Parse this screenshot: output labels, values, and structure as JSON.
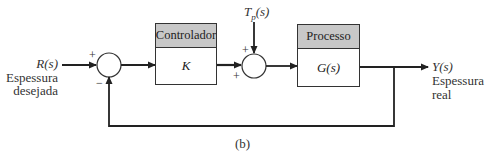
{
  "diagram": {
    "type": "block-diagram",
    "caption": "(b)",
    "input": {
      "symbol": "R(s)",
      "label_line1": "Espessura",
      "label_line2": "desejada"
    },
    "output": {
      "symbol": "Y(s)",
      "label_line1": "Espessura",
      "label_line2": "real"
    },
    "disturbance": {
      "symbol": "T",
      "subscript": "p",
      "suffix": "(s)"
    },
    "controller": {
      "title": "Controlador",
      "transfer": "K"
    },
    "process": {
      "title": "Processo",
      "transfer": "G(s)"
    },
    "summing_junction_1": {
      "plus_sign": "+",
      "minus_sign": "−"
    },
    "summing_junction_2": {
      "top_sign": "+",
      "left_sign": "+"
    },
    "colors": {
      "line": "#222222",
      "header_fill": "#c8c8c8",
      "background": "#ffffff"
    }
  }
}
